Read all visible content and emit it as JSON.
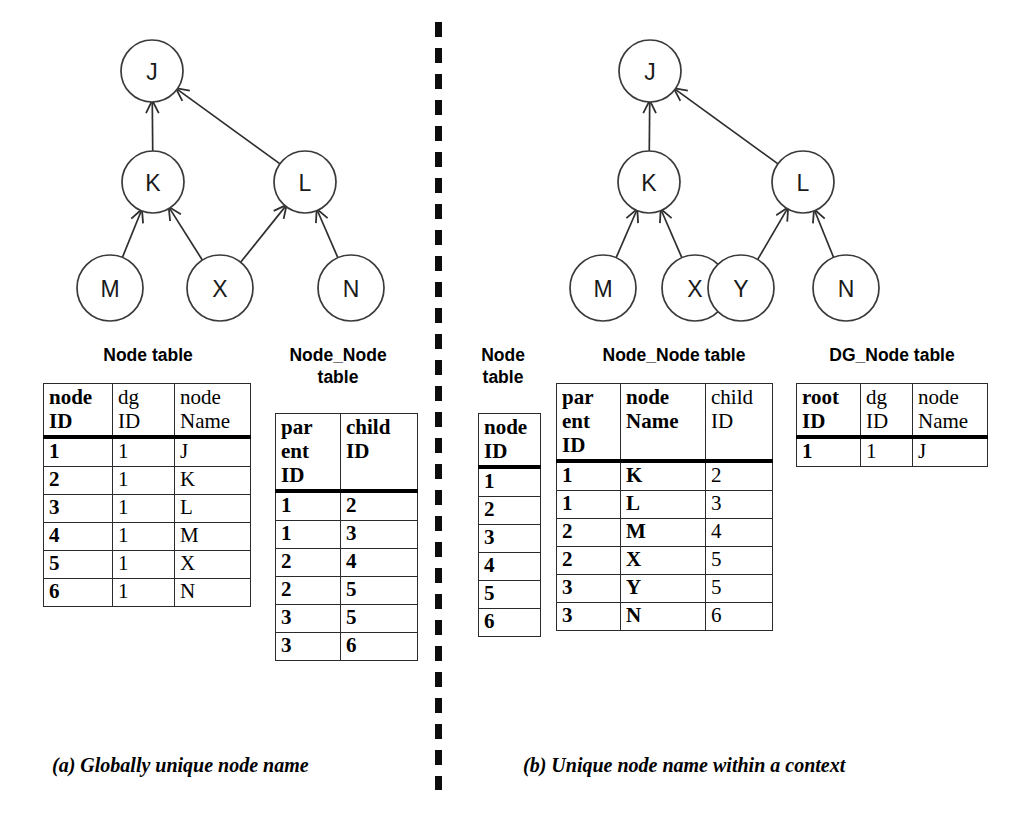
{
  "graphs": {
    "left": {
      "nodes": [
        {
          "id": "J",
          "label": "J",
          "cx": 152,
          "cy": 71,
          "r": 31
        },
        {
          "id": "K",
          "label": "K",
          "cx": 153,
          "cy": 182,
          "r": 31
        },
        {
          "id": "L",
          "label": "L",
          "cx": 305,
          "cy": 182,
          "r": 31
        },
        {
          "id": "M",
          "label": "M",
          "cx": 110,
          "cy": 288,
          "r": 33
        },
        {
          "id": "X",
          "label": "X",
          "cx": 220,
          "cy": 288,
          "r": 33
        },
        {
          "id": "N",
          "label": "N",
          "cx": 351,
          "cy": 288,
          "r": 33
        }
      ],
      "edges": [
        {
          "from": "K",
          "to": "J"
        },
        {
          "from": "L",
          "to": "J"
        },
        {
          "from": "M",
          "to": "K"
        },
        {
          "from": "X",
          "to": "K"
        },
        {
          "from": "X",
          "to": "L"
        },
        {
          "from": "N",
          "to": "L"
        }
      ]
    },
    "right": {
      "nodes": [
        {
          "id": "J",
          "label": "J",
          "cx": 650,
          "cy": 71,
          "r": 31
        },
        {
          "id": "K",
          "label": "K",
          "cx": 649,
          "cy": 182,
          "r": 31
        },
        {
          "id": "L",
          "label": "L",
          "cx": 803,
          "cy": 182,
          "r": 31
        },
        {
          "id": "M",
          "label": "M",
          "cx": 603,
          "cy": 288,
          "r": 33
        },
        {
          "id": "X",
          "label": "X",
          "cx": 695,
          "cy": 288,
          "r": 33
        },
        {
          "id": "Y",
          "label": "Y",
          "cx": 741,
          "cy": 288,
          "r": 33
        },
        {
          "id": "N",
          "label": "N",
          "cx": 846,
          "cy": 288,
          "r": 33
        }
      ],
      "edges": [
        {
          "from": "K",
          "to": "J"
        },
        {
          "from": "L",
          "to": "J"
        },
        {
          "from": "M",
          "to": "K"
        },
        {
          "from": "X",
          "to": "K"
        },
        {
          "from": "Y",
          "to": "L"
        },
        {
          "from": "N",
          "to": "L"
        }
      ]
    }
  },
  "left_panel": {
    "node_table": {
      "title": "Node table",
      "columns": [
        {
          "label": "node\nID",
          "bold": true
        },
        {
          "label": "dg\nID",
          "bold": false
        },
        {
          "label": "node\nName",
          "bold": false
        }
      ],
      "rows": [
        [
          "1",
          "1",
          "J"
        ],
        [
          "2",
          "1",
          "K"
        ],
        [
          "3",
          "1",
          "L"
        ],
        [
          "4",
          "1",
          "M"
        ],
        [
          "5",
          "1",
          "X"
        ],
        [
          "6",
          "1",
          "N"
        ]
      ]
    },
    "node_node_table": {
      "title": "Node_Node\ntable",
      "columns": [
        {
          "label": "par\nent\nID",
          "bold": true
        },
        {
          "label": "child\nID",
          "bold": true
        }
      ],
      "rows": [
        [
          "1",
          "2"
        ],
        [
          "1",
          "3"
        ],
        [
          "2",
          "4"
        ],
        [
          "2",
          "5"
        ],
        [
          "3",
          "5"
        ],
        [
          "3",
          "6"
        ]
      ]
    },
    "caption": "(a) Globally unique node name"
  },
  "right_panel": {
    "node_table": {
      "title": "Node\ntable",
      "columns": [
        {
          "label": "node\nID",
          "bold": true
        }
      ],
      "rows": [
        [
          "1"
        ],
        [
          "2"
        ],
        [
          "3"
        ],
        [
          "4"
        ],
        [
          "5"
        ],
        [
          "6"
        ]
      ]
    },
    "node_node_table": {
      "title": "Node_Node table",
      "columns": [
        {
          "label": "par\nent\nID",
          "bold": true
        },
        {
          "label": "node\nName",
          "bold": true
        },
        {
          "label": "child\nID",
          "bold": false
        }
      ],
      "rows": [
        [
          "1",
          "K",
          "2"
        ],
        [
          "1",
          "L",
          "3"
        ],
        [
          "2",
          "M",
          "4"
        ],
        [
          "2",
          "X",
          "5"
        ],
        [
          "3",
          "Y",
          "5"
        ],
        [
          "3",
          "N",
          "6"
        ]
      ]
    },
    "dg_node_table": {
      "title": "DG_Node table",
      "columns": [
        {
          "label": "root\nID",
          "bold": true
        },
        {
          "label": "dg\nID",
          "bold": false
        },
        {
          "label": "node\nName",
          "bold": false
        }
      ],
      "rows": [
        [
          "1",
          "1",
          "J"
        ]
      ]
    },
    "caption": "(b) Unique node name within a context"
  },
  "colors": {
    "stroke": "#2e2e2e",
    "text": "#000000",
    "background": "#ffffff"
  }
}
